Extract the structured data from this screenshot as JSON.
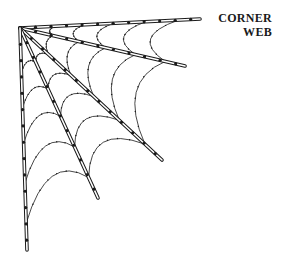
{
  "caption": {
    "line1": "CORNER",
    "line2": "WEB"
  },
  "colors": {
    "ink": "#1a1a1a",
    "background": "#ffffff"
  },
  "web": {
    "origin": [
      20,
      28
    ],
    "spokes": [
      {
        "name": "spoke-top",
        "end": [
          200,
          19
        ]
      },
      {
        "name": "spoke-upper",
        "end": [
          185,
          66
        ]
      },
      {
        "name": "spoke-middle",
        "end": [
          162,
          160
        ]
      },
      {
        "name": "spoke-lower",
        "end": [
          98,
          198
        ]
      },
      {
        "name": "spoke-left",
        "end": [
          27,
          250
        ]
      }
    ],
    "ring_fractions": [
      0.2,
      0.36,
      0.52,
      0.7,
      0.88
    ]
  }
}
